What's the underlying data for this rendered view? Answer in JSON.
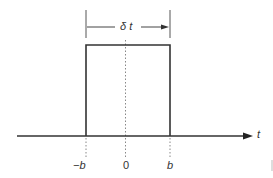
{
  "diagram": {
    "type": "rectangular pulse",
    "width_label": "δ t",
    "axis_label": "t",
    "ticks": [
      {
        "label": "−b",
        "position": "left edge"
      },
      {
        "label": "0",
        "position": "center"
      },
      {
        "label": "b",
        "position": "right edge"
      }
    ],
    "colors": {
      "line": "#333333",
      "dotted": "#888888",
      "background": "#ffffff"
    }
  }
}
